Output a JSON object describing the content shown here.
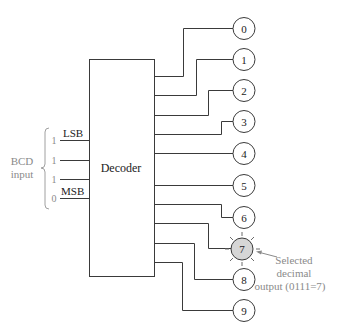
{
  "decoder": {
    "label": "Decoder"
  },
  "inputs": {
    "group_label_line1": "BCD",
    "group_label_line2": "input",
    "lines": [
      {
        "bit": "1",
        "label": "LSB"
      },
      {
        "bit": "1",
        "label": ""
      },
      {
        "bit": "1",
        "label": ""
      },
      {
        "bit": "0",
        "label": "MSB"
      }
    ]
  },
  "outputs": [
    {
      "label": "0",
      "selected": false
    },
    {
      "label": "1",
      "selected": false
    },
    {
      "label": "2",
      "selected": false
    },
    {
      "label": "3",
      "selected": false
    },
    {
      "label": "4",
      "selected": false
    },
    {
      "label": "5",
      "selected": false
    },
    {
      "label": "6",
      "selected": false
    },
    {
      "label": "7",
      "selected": true
    },
    {
      "label": "8",
      "selected": false
    },
    {
      "label": "9",
      "selected": false
    }
  ],
  "annotation": {
    "line1": "Selected",
    "line2": "decimal",
    "line3": "output (0111=7)"
  },
  "colors": {
    "line": "#3a3a3a",
    "annotation_text": "#8a8a8a",
    "selected_fill": "#d6d6d6"
  }
}
